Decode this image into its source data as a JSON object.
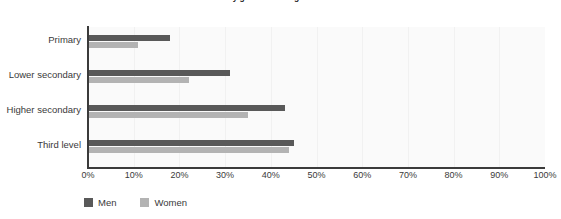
{
  "chart_data": {
    "type": "bar",
    "orientation": "horizontal",
    "title": "...rate by gender and highest education",
    "categories": [
      "Primary",
      "Lower secondary",
      "Higher secondary",
      "Third level"
    ],
    "series": [
      {
        "name": "Men",
        "color": "#595959",
        "values": [
          18,
          31,
          43,
          45
        ]
      },
      {
        "name": "Women",
        "color": "#b3b3b3",
        "values": [
          11,
          22,
          35,
          44
        ]
      }
    ],
    "xlabel": "",
    "ylabel": "",
    "xlim": [
      0,
      100
    ],
    "xticks": [
      0,
      10,
      20,
      30,
      40,
      50,
      60,
      70,
      80,
      90,
      100
    ],
    "xtick_labels": [
      "0%",
      "10%",
      "20%",
      "30%",
      "40%",
      "50%",
      "60%",
      "70%",
      "80%",
      "90%",
      "100%"
    ],
    "grid": "vertical",
    "legend_position": "bottom-left",
    "plot_background": "#fafafa",
    "axis_color": "#3b3b3b"
  }
}
